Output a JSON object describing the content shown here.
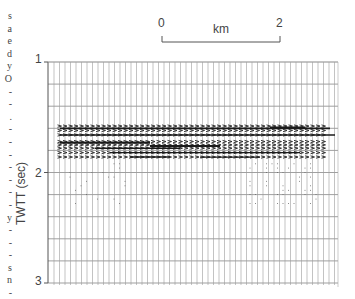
{
  "figure": {
    "type": "seismic-section",
    "scale_bar": {
      "start_label": "0",
      "end_label": "2",
      "unit_label": "km"
    },
    "y_axis": {
      "label": "TWTT  (sec)",
      "ticks": [
        "1",
        "2",
        "3"
      ],
      "range": [
        1,
        3
      ]
    },
    "left_margin_text": [
      "s",
      "a",
      "e",
      "d",
      "y",
      "O",
      "-",
      "-",
      ".",
      "-",
      "-",
      "-",
      "-",
      "-",
      "-",
      "-",
      "y",
      "-",
      "-",
      "-",
      "s",
      "n",
      "-",
      "s"
    ],
    "reflectors_twtt_sec": [
      1.58,
      1.62,
      1.66,
      1.72,
      1.75,
      1.78,
      1.82,
      1.86
    ],
    "colors": {
      "ink": "#222222",
      "grid": "#555555",
      "background": "#ffffff"
    }
  }
}
